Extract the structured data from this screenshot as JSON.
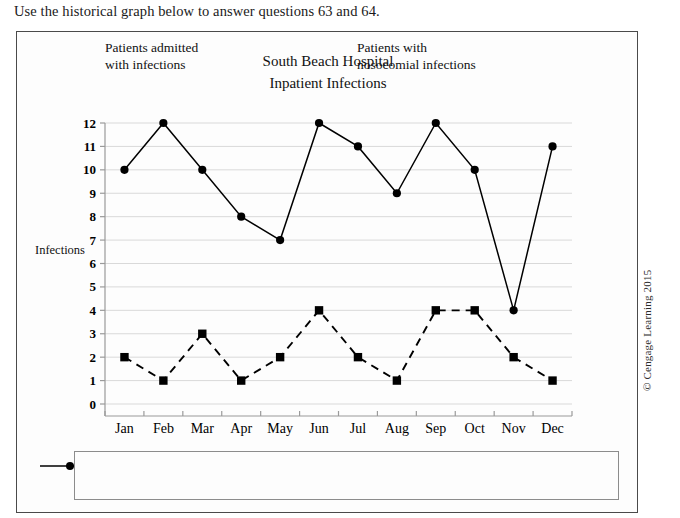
{
  "question_line": "Use the historical graph below to answer questions 63 and 64.",
  "figure": {
    "title_line1": "South Beach Hospital",
    "title_line2": "Inpatient Infections",
    "y_axis_title": "Infections",
    "copyright": "© Cengage Learning 2015"
  },
  "legend": {
    "entries": [
      {
        "line1": "Patients admitted",
        "line2": "with infections",
        "marker": "circle-marker",
        "style": "solid"
      },
      {
        "line1": "Patients with",
        "line2": "nosocomial infections",
        "marker": "square-marker",
        "style": "dashed"
      }
    ]
  },
  "colors": {
    "series": "#000000",
    "gridline": "#d9d9d9",
    "axis": "#9a9a9a",
    "frame": "#4a4a4a",
    "background": "#fdfdfd"
  },
  "chart_data": {
    "type": "line",
    "title": "South Beach Hospital Inpatient Infections",
    "xlabel": "",
    "ylabel": "Infections",
    "ylim": [
      0,
      12
    ],
    "yticks": [
      0,
      1,
      2,
      3,
      4,
      5,
      6,
      7,
      8,
      9,
      10,
      11,
      12
    ],
    "grid": true,
    "legend_position": "bottom",
    "categories": [
      "Jan",
      "Feb",
      "Mar",
      "Apr",
      "May",
      "Jun",
      "Jul",
      "Aug",
      "Sep",
      "Oct",
      "Nov",
      "Dec"
    ],
    "series": [
      {
        "name": "Patients admitted with infections",
        "style": "solid",
        "marker": "circle",
        "values": [
          10,
          12,
          10,
          8,
          7,
          12,
          11,
          9,
          12,
          10,
          4,
          11
        ]
      },
      {
        "name": "Patients with nosocomial infections",
        "style": "dashed",
        "marker": "square",
        "values": [
          2,
          1,
          3,
          1,
          2,
          4,
          2,
          1,
          4,
          4,
          2,
          1
        ]
      }
    ]
  }
}
